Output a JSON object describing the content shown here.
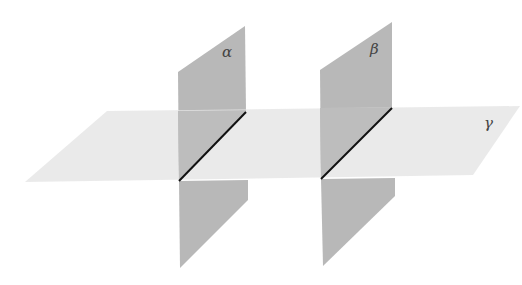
{
  "diagram": {
    "planes": [
      {
        "id": "alpha",
        "label": "α",
        "orientation": "vertical"
      },
      {
        "id": "beta",
        "label": "β",
        "orientation": "vertical"
      },
      {
        "id": "gamma",
        "label": "γ",
        "orientation": "horizontal"
      }
    ],
    "colors": {
      "vertical_plane": "#b8b8b8",
      "horizontal_plane": "#e6e6e6",
      "intersection_line": "#111111"
    }
  }
}
